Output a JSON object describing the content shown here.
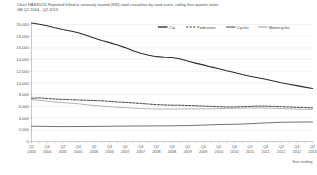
{
  "header": {
    "title": "Chart RAS45011      Reported killed or seriously injured (KSI) road casualties by road users, rolling four quarter totals",
    "subtitle": "GB Q2 2004  -  Q2 2013"
  },
  "colors": {
    "car": "#2b2b2b",
    "pedestrian": "#3c3c3c",
    "cyclist": "#4d4d4d",
    "motorcyclist": "#9a9a9a",
    "grid": "#d9d9d9",
    "axis": "#8a8a8a",
    "background": "#ffffff"
  },
  "chart_data": {
    "type": "line",
    "title": "Chart RAS45011      Reported killed or seriously injured (KSI) road casualties by road users, rolling four quarter totals",
    "subtitle": "GB Q2 2004  -  Q2 2013",
    "xlabel": "Year ending",
    "ylabel": "Number of reported KSI casualties",
    "ylim": [
      0,
      20000
    ],
    "ytick_step": 2000,
    "grid": true,
    "legend_position": "top-right",
    "ytick_labels": [
      "20,000",
      "18,000",
      "16,000",
      "14,000",
      "12,000",
      "10,000",
      "8,000",
      "6,000",
      "4,000",
      "2,000",
      "0"
    ],
    "ytick_values": [
      20000,
      18000,
      16000,
      14000,
      12000,
      10000,
      8000,
      6000,
      4000,
      2000,
      0
    ],
    "x": [
      "Q2 2004",
      "Q3 2004",
      "Q4 2004",
      "Q1 2005",
      "Q2 2005",
      "Q3 2005",
      "Q4 2005",
      "Q1 2006",
      "Q2 2006",
      "Q3 2006",
      "Q4 2006",
      "Q1 2007",
      "Q2 2007",
      "Q3 2007",
      "Q4 2007",
      "Q1 2008",
      "Q2 2008",
      "Q3 2008",
      "Q4 2008",
      "Q1 2009",
      "Q2 2009",
      "Q3 2009",
      "Q4 2009",
      "Q1 2010",
      "Q2 2010",
      "Q3 2010",
      "Q4 2010",
      "Q1 2011",
      "Q2 2011",
      "Q3 2011",
      "Q4 2011",
      "Q1 2012",
      "Q2 2012",
      "Q3 2012",
      "Q4 2012",
      "Q1 2013",
      "Q2 2013"
    ],
    "xtick_labels": [
      {
        "q": "Q2",
        "y": "2004"
      },
      {
        "q": "Q4",
        "y": "2004"
      },
      {
        "q": "Q2",
        "y": "2005"
      },
      {
        "q": "Q4",
        "y": "2005"
      },
      {
        "q": "Q2",
        "y": "2006"
      },
      {
        "q": "Q4",
        "y": "2006"
      },
      {
        "q": "Q2",
        "y": "2007"
      },
      {
        "q": "Q4",
        "y": "2007"
      },
      {
        "q": "Q2",
        "y": "2008"
      },
      {
        "q": "Q4",
        "y": "2008"
      },
      {
        "q": "Q2",
        "y": "2009"
      },
      {
        "q": "Q4",
        "y": "2009"
      },
      {
        "q": "Q2",
        "y": "2010"
      },
      {
        "q": "Q4",
        "y": "2010"
      },
      {
        "q": "Q2",
        "y": "2011"
      },
      {
        "q": "Q4",
        "y": "2011"
      },
      {
        "q": "Q2",
        "y": "2012"
      },
      {
        "q": "Q4",
        "y": "2012"
      },
      {
        "q": "Q2",
        "y": "2013"
      }
    ],
    "series": [
      {
        "name": "Car",
        "style": "solid",
        "width": 1.1,
        "color": "#2b2b2b",
        "values": [
          20250,
          20050,
          19800,
          19450,
          19150,
          18900,
          18600,
          18150,
          17700,
          17250,
          16900,
          16500,
          16050,
          15500,
          15100,
          14750,
          14500,
          14400,
          14350,
          14150,
          13750,
          13400,
          13100,
          12750,
          12450,
          12100,
          11800,
          11450,
          11150,
          10900,
          10650,
          10350,
          10050,
          9800,
          9550,
          9300,
          9050
        ]
      },
      {
        "name": "Pedestrian",
        "style": "dashed",
        "width": 0.95,
        "color": "#3c3c3c",
        "values": [
          7400,
          7450,
          7350,
          7250,
          7200,
          7150,
          7100,
          7050,
          7000,
          6950,
          6850,
          6750,
          6700,
          6600,
          6500,
          6400,
          6300,
          6250,
          6200,
          6200,
          6150,
          6100,
          6050,
          6000,
          5950,
          5900,
          5900,
          5950,
          6000,
          6050,
          6050,
          6000,
          5950,
          5900,
          5850,
          5800,
          5750
        ]
      },
      {
        "name": "Cyclist",
        "style": "solid",
        "width": 0.8,
        "color": "#4d4d4d",
        "values": [
          2600,
          2600,
          2580,
          2560,
          2550,
          2550,
          2560,
          2570,
          2580,
          2590,
          2600,
          2620,
          2630,
          2650,
          2650,
          2660,
          2670,
          2680,
          2680,
          2700,
          2720,
          2760,
          2800,
          2850,
          2900,
          2930,
          2950,
          2980,
          3050,
          3120,
          3180,
          3230,
          3280,
          3300,
          3320,
          3330,
          3340
        ]
      },
      {
        "name": "Motorcyclist",
        "style": "solid",
        "width": 0.75,
        "color": "#9a9a9a",
        "values": [
          7150,
          7050,
          6900,
          6750,
          6650,
          6550,
          6450,
          6300,
          6150,
          6050,
          5950,
          5850,
          5800,
          5700,
          5650,
          5600,
          5550,
          5550,
          5550,
          5560,
          5570,
          5580,
          5580,
          5600,
          5620,
          5650,
          5680,
          5700,
          5720,
          5730,
          5720,
          5680,
          5630,
          5580,
          5540,
          5500,
          5480
        ]
      }
    ]
  },
  "legend": {
    "items": [
      {
        "label": "Car"
      },
      {
        "label": "Pedestrian"
      },
      {
        "label": "Cyclist"
      },
      {
        "label": "Motorcyclist"
      }
    ]
  }
}
